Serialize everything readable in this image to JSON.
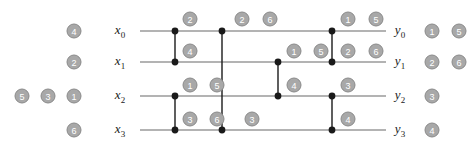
{
  "diagram": {
    "type": "comparison-network",
    "title": "",
    "geometry": {
      "wire_x_start": 140,
      "wire_x_end": 386,
      "wire_rows_y": [
        31,
        62,
        96,
        130
      ],
      "node_radius": 3.4,
      "badge_radius": 7.5
    },
    "colors": {
      "wire": "#9a9a9a",
      "node": "#1a1a1a",
      "badge_fill": "#a8a8a8",
      "badge_stroke": "#8a8a8a",
      "badge_text": "#ffffff",
      "label_text": "#1a1a1a",
      "background": "#ffffff"
    },
    "input_labels": [
      {
        "name": "x0",
        "base": "x",
        "sub": "0",
        "x": 120,
        "y": 31
      },
      {
        "name": "x1",
        "base": "x",
        "sub": "1",
        "x": 120,
        "y": 62
      },
      {
        "name": "x2",
        "base": "x",
        "sub": "2",
        "x": 120,
        "y": 96
      },
      {
        "name": "x3",
        "base": "x",
        "sub": "3",
        "x": 120,
        "y": 130
      }
    ],
    "output_labels": [
      {
        "name": "y0",
        "base": "y",
        "sub": "0",
        "x": 400,
        "y": 31
      },
      {
        "name": "y1",
        "base": "y",
        "sub": "1",
        "x": 400,
        "y": 62
      },
      {
        "name": "y2",
        "base": "y",
        "sub": "2",
        "x": 400,
        "y": 96
      },
      {
        "name": "y3",
        "base": "y",
        "sub": "3",
        "x": 400,
        "y": 130
      }
    ],
    "wires": [
      {
        "name": "wire-x0",
        "y": 31
      },
      {
        "name": "wire-x1",
        "y": 62
      },
      {
        "name": "wire-x2",
        "y": 96
      },
      {
        "name": "wire-x3",
        "y": 130
      }
    ],
    "comparators": [
      {
        "name": "comparator-1",
        "x": 175,
        "top_y": 31,
        "bottom_y": 62,
        "top_row": 0,
        "bottom_row": 1
      },
      {
        "name": "comparator-2",
        "x": 175,
        "top_y": 96,
        "bottom_y": 130,
        "top_row": 2,
        "bottom_row": 3
      },
      {
        "name": "comparator-3",
        "x": 222,
        "top_y": 31,
        "bottom_y": 130,
        "top_row": 0,
        "bottom_row": 3
      },
      {
        "name": "comparator-4",
        "x": 278,
        "top_y": 62,
        "bottom_y": 96,
        "top_row": 1,
        "bottom_row": 2
      },
      {
        "name": "comparator-5",
        "x": 332,
        "top_y": 31,
        "bottom_y": 62,
        "top_row": 0,
        "bottom_row": 1
      },
      {
        "name": "comparator-6",
        "x": 332,
        "top_y": 96,
        "bottom_y": 130,
        "top_row": 2,
        "bottom_row": 3
      }
    ],
    "input_values": [
      {
        "name": "input-x0-v1",
        "value": "4",
        "x": 74,
        "y": 31
      },
      {
        "name": "input-x1-v1",
        "value": "2",
        "x": 74,
        "y": 62
      },
      {
        "name": "input-x2-v1",
        "value": "5",
        "x": 22,
        "y": 96
      },
      {
        "name": "input-x2-v2",
        "value": "3",
        "x": 48,
        "y": 96
      },
      {
        "name": "input-x2-v3",
        "value": "1",
        "x": 74,
        "y": 96
      },
      {
        "name": "input-x3-v1",
        "value": "6",
        "x": 74,
        "y": 130
      }
    ],
    "output_values": [
      {
        "name": "output-y0-v1",
        "value": "1",
        "x": 432,
        "y": 31
      },
      {
        "name": "output-y0-v2",
        "value": "5",
        "x": 459,
        "y": 31
      },
      {
        "name": "output-y1-v1",
        "value": "2",
        "x": 432,
        "y": 62
      },
      {
        "name": "output-y1-v2",
        "value": "6",
        "x": 459,
        "y": 62
      },
      {
        "name": "output-y2-v1",
        "value": "3",
        "x": 432,
        "y": 96
      },
      {
        "name": "output-y3-v1",
        "value": "4",
        "x": 432,
        "y": 130
      }
    ],
    "stage_values": [
      {
        "name": "stage-value-above-x0-a",
        "value": "2",
        "x": 190,
        "y": 19
      },
      {
        "name": "stage-value-above-x0-b",
        "value": "2",
        "x": 242,
        "y": 19
      },
      {
        "name": "stage-value-above-x0-c",
        "value": "6",
        "x": 270,
        "y": 19
      },
      {
        "name": "stage-value-above-x0-d",
        "value": "1",
        "x": 348,
        "y": 19
      },
      {
        "name": "stage-value-above-x0-e",
        "value": "5",
        "x": 376,
        "y": 19
      },
      {
        "name": "stage-value-mid-01-a",
        "value": "4",
        "x": 190,
        "y": 51
      },
      {
        "name": "stage-value-mid-01-b",
        "value": "1",
        "x": 294,
        "y": 51
      },
      {
        "name": "stage-value-mid-01-c",
        "value": "5",
        "x": 321,
        "y": 51
      },
      {
        "name": "stage-value-mid-01-d",
        "value": "2",
        "x": 348,
        "y": 51
      },
      {
        "name": "stage-value-mid-01-e",
        "value": "6",
        "x": 376,
        "y": 51
      },
      {
        "name": "stage-value-mid-12-a",
        "value": "1",
        "x": 190,
        "y": 85
      },
      {
        "name": "stage-value-mid-12-b",
        "value": "5",
        "x": 217,
        "y": 85
      },
      {
        "name": "stage-value-mid-12-c",
        "value": "4",
        "x": 294,
        "y": 85
      },
      {
        "name": "stage-value-mid-12-d",
        "value": "3",
        "x": 348,
        "y": 85
      },
      {
        "name": "stage-value-mid-23-a",
        "value": "3",
        "x": 190,
        "y": 119
      },
      {
        "name": "stage-value-mid-23-b",
        "value": "6",
        "x": 217,
        "y": 119
      },
      {
        "name": "stage-value-mid-23-c",
        "value": "3",
        "x": 252,
        "y": 119
      },
      {
        "name": "stage-value-mid-23-d",
        "value": "4",
        "x": 348,
        "y": 119
      }
    ]
  }
}
